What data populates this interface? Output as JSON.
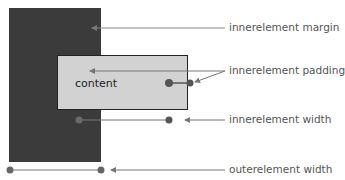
{
  "diagram": {
    "content_label": "content",
    "labels": {
      "margin": "innerelement margin",
      "padding": "innerelement padding",
      "inner_width": "innerelement width",
      "outer_width": "outerelement width"
    },
    "colors": {
      "outer_box": "#3b3b3b",
      "inner_box": "#d2d2d2",
      "lines": "#777777",
      "dots": "#555555"
    }
  }
}
